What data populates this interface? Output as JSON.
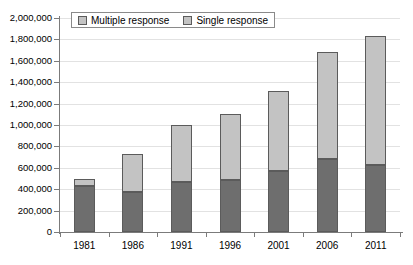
{
  "chart_data": {
    "type": "bar",
    "stacked": true,
    "title": "",
    "xlabel": "",
    "ylabel": "",
    "categories": [
      "1981",
      "1986",
      "1991",
      "1996",
      "2001",
      "2006",
      "2011"
    ],
    "series": [
      {
        "name": "Single response",
        "color": "#6e6e6e",
        "values": [
          430000,
          375000,
          470000,
          485000,
          570000,
          680000,
          625000
        ]
      },
      {
        "name": "Multiple response",
        "color": "#c3c3c3",
        "values": [
          70000,
          350000,
          530000,
          615000,
          745000,
          1000000,
          1205000
        ]
      }
    ],
    "totals": [
      500000,
      725000,
      1000000,
      1100000,
      1315000,
      1680000,
      1830000
    ],
    "ylim": [
      0,
      2000000
    ],
    "ytick_values": [
      0,
      200000,
      400000,
      600000,
      800000,
      1000000,
      1200000,
      1400000,
      1600000,
      1800000,
      2000000
    ],
    "ytick_labels": [
      "0",
      "200,000",
      "400,000",
      "600,000",
      "800,000",
      "1,000,000",
      "1,200,000",
      "1,400,000",
      "1,600,000",
      "1,800,000",
      "2,000,000"
    ],
    "grid": true,
    "legend_position": "top-left",
    "legend": [
      "Multiple response",
      "Single response"
    ]
  },
  "legend": {
    "entries": [
      {
        "label": "Multiple response",
        "swatch": "legend-swatch-multiple"
      },
      {
        "label": "Single response",
        "swatch": "legend-swatch-single"
      }
    ]
  },
  "colors": {
    "single_response": "#6e6e6e",
    "multiple_response": "#c3c3c3",
    "bar_outline": "#5b5b5b",
    "gridline": "#e2e2e2",
    "axis": "#7b7b7b",
    "background": "#ffffff"
  }
}
